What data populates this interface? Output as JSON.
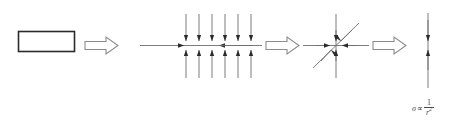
{
  "figure": {
    "background_color": "#ffffff",
    "line_color": "#3a3a3a",
    "arrow_outline_color": "#8c8c8c",
    "arrow_fill_color": "#ffffff",
    "width": 461,
    "height": 134
  },
  "stages": [
    {
      "id": "stage-1-rectangle",
      "name": "rectangle-block",
      "description": "Plain rectangular block outline",
      "shape": "rectangle",
      "x": 18,
      "y": 31,
      "width": 57,
      "height": 21
    },
    {
      "id": "stage-2-distributed-load",
      "name": "distributed-load-field",
      "description": "Six vertical field lines with arrowheads converging from top and bottom onto a horizontal axis, plus horizontal arrows converging from left and right",
      "vertical_line_count": 6,
      "vertical_line_x": [
        186,
        199,
        212,
        225,
        238,
        251
      ],
      "vertical_top": 14,
      "vertical_bottom": 78,
      "horizontal_axis_y": 45,
      "horizontal_left": 140,
      "horizontal_right": 262,
      "arrow_directions": [
        "down",
        "up",
        "right",
        "left"
      ]
    },
    {
      "id": "stage-3-point-convergence",
      "name": "point-convergence-star",
      "description": "Vertical, horizontal and diagonal lines all converging with arrowheads onto a single point",
      "center_x": 336,
      "center_y": 45,
      "vertical_top": 14,
      "vertical_bottom": 78,
      "horizontal_left": 303,
      "horizontal_right": 369,
      "diagonal_angle_degrees": 45,
      "arrow_directions": [
        "down",
        "up",
        "right",
        "left",
        "down-left",
        "up-right"
      ]
    },
    {
      "id": "stage-4-line-load",
      "name": "single-line-load",
      "description": "Single vertical line with two arrowheads converging at its midpoint",
      "x": 428,
      "top": 13,
      "bottom": 88,
      "arrow_meet_y": 45,
      "arrow_directions": [
        "down",
        "up"
      ]
    }
  ],
  "transition_arrows": [
    {
      "id": "transition-arrow-1",
      "name": "block-arrow-right",
      "x": 84,
      "y": 37,
      "width": 34,
      "height": 17
    },
    {
      "id": "transition-arrow-2",
      "name": "block-arrow-right",
      "x": 265,
      "y": 37,
      "width": 34,
      "height": 17
    },
    {
      "id": "transition-arrow-3",
      "name": "block-arrow-right",
      "x": 372,
      "y": 37,
      "width": 34,
      "height": 17
    }
  ],
  "annotations": {
    "formula": {
      "name": "stress-scaling-formula",
      "plain_text": "σ ∝ 1/r²",
      "sigma": "σ",
      "proportional": "∝",
      "numerator": "1",
      "denominator_base": "r",
      "denominator_exponent": "2",
      "x": 412,
      "y": 99,
      "color": "#4a4a4a"
    }
  }
}
